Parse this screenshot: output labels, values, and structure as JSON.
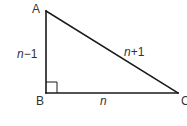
{
  "diagram": {
    "type": "right-triangle",
    "vertices": {
      "A": {
        "label": "A",
        "x": 46,
        "y": 11
      },
      "B": {
        "label": "B",
        "x": 46,
        "y": 93
      },
      "C": {
        "label": "C",
        "x": 178,
        "y": 93
      }
    },
    "right_angle_at": "B",
    "sides": {
      "AB": {
        "variable": "n",
        "suffix": "−1",
        "full": "n−1"
      },
      "BC": {
        "variable": "n",
        "suffix": "",
        "full": "n"
      },
      "AC": {
        "variable": "n",
        "suffix": "+1",
        "full": "n+1"
      }
    },
    "colors": {
      "line": "#1a1a1a",
      "text": "#333333",
      "background": "#ffffff"
    }
  }
}
